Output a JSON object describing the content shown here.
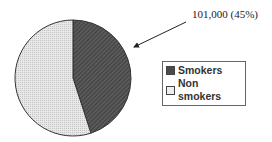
{
  "chart_data": {
    "type": "pie",
    "title": "",
    "categories": [
      "Smokers",
      "Non smokers"
    ],
    "values": [
      45,
      55
    ],
    "colors": [
      "#4a4a4a",
      "#e4e4e4"
    ],
    "annotations": [
      {
        "target": "Smokers",
        "text": "101,000 (45%)",
        "arrow": true
      }
    ],
    "legend_position": "right",
    "start_angle_deg": 0,
    "direction": "clockwise"
  },
  "annotation": {
    "text": "101,000 (45%)"
  },
  "legend": {
    "items": [
      {
        "label": "Smokers",
        "color": "#4a4a4a"
      },
      {
        "label": "Non smokers",
        "color": "#e4e4e4"
      }
    ]
  }
}
